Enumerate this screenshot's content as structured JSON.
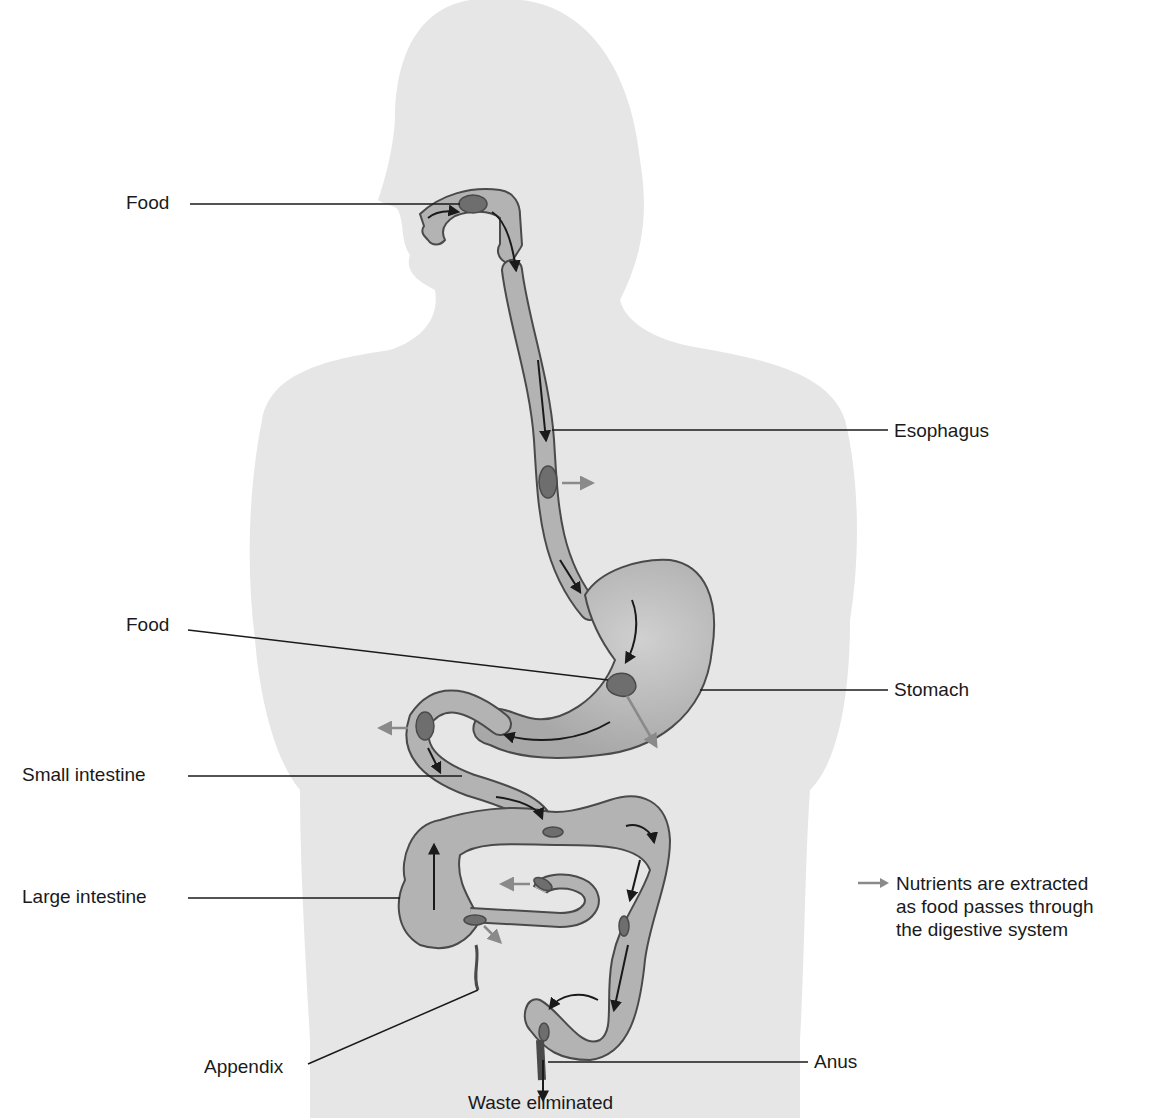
{
  "diagram": {
    "labels": {
      "food_mouth": "Food",
      "esophagus": "Esophagus",
      "food_stomach": "Food",
      "stomach": "Stomach",
      "small_intestine": "Small intestine",
      "large_intestine": "Large intestine",
      "appendix": "Appendix",
      "anus": "Anus",
      "waste": "Waste eliminated"
    },
    "legend": {
      "icon": "gray-arrow-icon",
      "line1": "Nutrients are extracted",
      "line2": "as food passes through",
      "line3": "the digestive system"
    },
    "colors": {
      "body_silhouette": "#e6e6e6",
      "organ_fill": "#b3b3b3",
      "organ_outline": "#4a4a4a",
      "food_bolus": "#6e6e6e",
      "flow_arrow": "#1a1a1a",
      "nutrient_arrow": "#8a8a8a",
      "leader_line": "#1a1a1a"
    }
  }
}
